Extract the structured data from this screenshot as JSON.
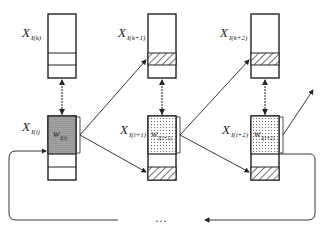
{
  "diagram": {
    "top_row": [
      {
        "label_main": "X",
        "label_sub": "I(k)",
        "hatch_text": ""
      },
      {
        "label_main": "X",
        "label_sub": "I(k+1)",
        "hatch_text": "1-LSB"
      },
      {
        "label_main": "X",
        "label_sub": "I(k+2)",
        "hatch_text": "2-LSB"
      }
    ],
    "bottom_row": [
      {
        "label_main": "X",
        "label_sub": "I(i)",
        "weight_main": "w",
        "weight_sub": "I(i)",
        "hatch_text": ""
      },
      {
        "label_main": "X",
        "label_sub": "I(i+1)",
        "weight_main": "w",
        "weight_sub": "I(i+1)",
        "hatch_text": "1-LSB"
      },
      {
        "label_main": "X",
        "label_sub": "I(i+2)",
        "weight_main": "w",
        "weight_sub": "I(i+2)",
        "hatch_text": "1-LSB"
      }
    ],
    "ellipsis": "…"
  }
}
